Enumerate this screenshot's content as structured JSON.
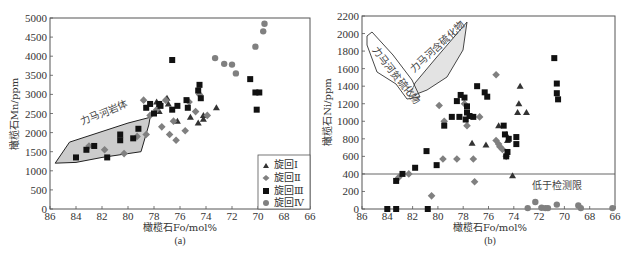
{
  "chart_data": [
    {
      "panel": "(a)",
      "type": "scatter",
      "xlabel": "橄榄石Fo/mol%",
      "ylabel": "橄榄石Mn/ppm",
      "xlim": [
        86,
        66
      ],
      "ylim": [
        0,
        5000
      ],
      "xticks": [
        86,
        84,
        82,
        80,
        78,
        76,
        74,
        72,
        70,
        68,
        66
      ],
      "yticks": [
        0,
        500,
        1000,
        1500,
        2000,
        2500,
        3000,
        3500,
        4000,
        4500,
        5000
      ],
      "grid": false,
      "legend_position": "lower right",
      "legend": [
        "旋回Ⅰ",
        "旋回Ⅱ",
        "旋回Ⅲ",
        "旋回Ⅳ"
      ],
      "annotations": [
        {
          "text": "力马河岩体",
          "type": "field polygon"
        }
      ],
      "field_polygon": [
        [
          85.6,
          1200
        ],
        [
          84.5,
          1750
        ],
        [
          80,
          2250
        ],
        [
          78.3,
          2400
        ],
        [
          78.4,
          2200
        ],
        [
          79,
          1500
        ],
        [
          82,
          1350
        ],
        [
          84,
          1220
        ]
      ],
      "series": [
        {
          "name": "旋回Ⅰ",
          "marker": "triangle",
          "color": "#333333",
          "points": [
            [
              77.8,
              2800
            ],
            [
              77,
              2900
            ],
            [
              76.2,
              2300
            ],
            [
              75.2,
              2400
            ],
            [
              74.6,
              2250
            ],
            [
              74.2,
              2350
            ],
            [
              74.2,
              2450
            ],
            [
              73.2,
              2650
            ],
            [
              77.6,
              2550
            ],
            [
              76.9,
              2750
            ]
          ]
        },
        {
          "name": "旋回Ⅱ",
          "marker": "diamond",
          "color": "#808080",
          "points": [
            [
              83,
              1650
            ],
            [
              81.8,
              1550
            ],
            [
              80.3,
              1450
            ],
            [
              79.3,
              1900
            ],
            [
              78.6,
              1950
            ],
            [
              78.8,
              2850
            ],
            [
              77.8,
              2600
            ],
            [
              78.3,
              2450
            ],
            [
              77.4,
              2150
            ],
            [
              76.3,
              1800
            ],
            [
              76.8,
              1950
            ],
            [
              75.6,
              2050
            ],
            [
              75.3,
              2800
            ],
            [
              74.8,
              2550
            ],
            [
              74.5,
              3000
            ],
            [
              73.9,
              2450
            ],
            [
              77.1,
              2850
            ],
            [
              76.5,
              2300
            ]
          ]
        },
        {
          "name": "旋回Ⅲ",
          "marker": "square",
          "color": "#111111",
          "points": [
            [
              84,
              1350
            ],
            [
              83.2,
              1550
            ],
            [
              82.6,
              1650
            ],
            [
              81.6,
              1350
            ],
            [
              80.6,
              1950
            ],
            [
              80.6,
              1800
            ],
            [
              79.6,
              1850
            ],
            [
              79.2,
              2100
            ],
            [
              78.6,
              2650
            ],
            [
              78.3,
              2750
            ],
            [
              77.6,
              2750
            ],
            [
              78,
              2500
            ],
            [
              77.5,
              2700
            ],
            [
              76.6,
              3900
            ],
            [
              75.5,
              2850
            ],
            [
              75.4,
              2650
            ],
            [
              74.6,
              3100
            ],
            [
              74.5,
              3250
            ],
            [
              74.4,
              2900
            ],
            [
              76.6,
              2600
            ],
            [
              76.2,
              2700
            ],
            [
              70.6,
              3400
            ],
            [
              70.2,
              3050
            ],
            [
              69.9,
              3050
            ],
            [
              70.1,
              2600
            ]
          ]
        },
        {
          "name": "旋回Ⅳ",
          "marker": "circle",
          "color": "#808080",
          "points": [
            [
              73.3,
              3950
            ],
            [
              72.6,
              3800
            ],
            [
              72,
              3780
            ],
            [
              71.7,
              3550
            ],
            [
              70.2,
              4250
            ],
            [
              69.6,
              4650
            ],
            [
              69.5,
              4850
            ]
          ]
        }
      ]
    },
    {
      "panel": "(b)",
      "type": "scatter",
      "xlabel": "橄榄石Fo/mol%",
      "ylabel": "橄榄石Ni/ppm",
      "xlim": [
        86,
        66
      ],
      "ylim": [
        0,
        2200
      ],
      "xticks": [
        86,
        84,
        82,
        80,
        78,
        76,
        74,
        72,
        70,
        68,
        66
      ],
      "yticks": [
        0,
        200,
        400,
        600,
        800,
        1000,
        1200,
        1400,
        1600,
        1800,
        2000,
        2200
      ],
      "grid": false,
      "detection_limit": 400,
      "annotations": [
        {
          "text": "力马河贫硫化物",
          "type": "field polygon"
        },
        {
          "text": "力马河含硫化物",
          "type": "field polygon"
        },
        {
          "text": "低于检测限",
          "type": "label"
        }
      ],
      "series": [
        {
          "name": "旋回Ⅰ",
          "marker": "triangle",
          "color": "#333333",
          "points": [
            [
              76.2,
              730
            ],
            [
              73.5,
              1400
            ],
            [
              73.6,
              1200
            ],
            [
              73.7,
              1100
            ],
            [
              73,
              1100
            ],
            [
              75.2,
              950
            ],
            [
              74.5,
              780
            ],
            [
              74.6,
              850
            ],
            [
              77.3,
              750
            ],
            [
              74.1,
              380
            ]
          ]
        },
        {
          "name": "旋回Ⅱ",
          "marker": "diamond",
          "color": "#808080",
          "points": [
            [
              83.1,
              360
            ],
            [
              82.3,
              400
            ],
            [
              80.5,
              150
            ],
            [
              79.6,
              570
            ],
            [
              78.5,
              570
            ],
            [
              77.2,
              570
            ],
            [
              77.1,
              310
            ],
            [
              77.7,
              950
            ],
            [
              77.9,
              1200
            ],
            [
              76.7,
              1050
            ],
            [
              75.4,
              1530
            ],
            [
              75.4,
              780
            ],
            [
              75.1,
              710
            ],
            [
              74.9,
              680
            ],
            [
              74.6,
              600
            ],
            [
              75.2,
              740
            ],
            [
              79.5,
              1000
            ],
            [
              79.9,
              1180
            ]
          ]
        },
        {
          "name": "旋回Ⅲ",
          "marker": "square",
          "color": "#111111",
          "points": [
            [
              84,
              0
            ],
            [
              83.3,
              0
            ],
            [
              80.8,
              0
            ],
            [
              83.3,
              320
            ],
            [
              82.8,
              400
            ],
            [
              81.8,
              470
            ],
            [
              80.9,
              660
            ],
            [
              80.1,
              500
            ],
            [
              79.5,
              950
            ],
            [
              78.9,
              1050
            ],
            [
              78.5,
              1230
            ],
            [
              78.2,
              1300
            ],
            [
              77.9,
              1270
            ],
            [
              77.7,
              1170
            ],
            [
              77.8,
              1020
            ],
            [
              76.9,
              1400
            ],
            [
              76.3,
              1330
            ],
            [
              76.1,
              1280
            ],
            [
              77.2,
              1050
            ],
            [
              78.3,
              1050
            ],
            [
              77.7,
              1100
            ],
            [
              77.5,
              1060
            ],
            [
              74.8,
              950
            ],
            [
              74.7,
              850
            ],
            [
              74.4,
              800
            ],
            [
              73.8,
              820
            ],
            [
              73.8,
              740
            ],
            [
              74.6,
              600
            ],
            [
              74.5,
              650
            ],
            [
              70.8,
              1720
            ],
            [
              70.6,
              1430
            ],
            [
              70.6,
              1320
            ],
            [
              70.5,
              1250
            ]
          ]
        },
        {
          "name": "旋回Ⅳ",
          "marker": "circle",
          "color": "#808080",
          "points": [
            [
              72.9,
              10
            ],
            [
              72.3,
              80
            ],
            [
              71.8,
              15
            ],
            [
              71.5,
              10
            ],
            [
              71.3,
              10
            ],
            [
              70.6,
              50
            ],
            [
              68.9,
              40
            ],
            [
              68.7,
              10
            ],
            [
              66.2,
              10
            ]
          ]
        }
      ]
    }
  ],
  "panels": {
    "a": {
      "caption": "(a)",
      "xlabel": "橄榄石Fo/mol%",
      "ylabel": "橄榄石Mn/ppm",
      "field_label": "力马河岩体",
      "legend": [
        {
          "label": "旋回Ⅰ",
          "marker": "triangle"
        },
        {
          "label": "旋回Ⅱ",
          "marker": "diamond"
        },
        {
          "label": "旋回Ⅲ",
          "marker": "square"
        },
        {
          "label": "旋回Ⅳ",
          "marker": "circle"
        }
      ]
    },
    "b": {
      "caption": "(b)",
      "xlabel": "橄榄石Fo/mol%",
      "ylabel": "橄榄石Ni/ppm",
      "field_label_1": "力马河贫硫化物",
      "field_label_2": "力马河含硫化物",
      "limit_label": "低于检测限"
    }
  }
}
